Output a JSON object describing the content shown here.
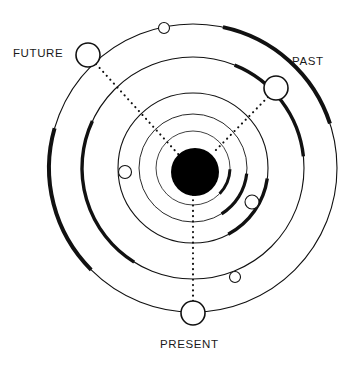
{
  "diagram": {
    "type": "concentric-orbit-diagram",
    "background_color": "#ffffff",
    "stroke_color": "#111111",
    "core_color": "#000000",
    "labels": {
      "future": "FUTURE",
      "past": "PAST",
      "present": "PRESENT"
    },
    "center": {
      "x": 193,
      "y": 168
    },
    "core": {
      "cx": 195,
      "cy": 172,
      "r": 24,
      "fill": "#000000"
    },
    "rings": [
      {
        "name": "ring-outer",
        "r": 144,
        "stroke_width": 1.1
      },
      {
        "name": "ring-second",
        "r": 111,
        "stroke_width": 1.1
      },
      {
        "name": "ring-third",
        "r": 75,
        "stroke_width": 1.1
      },
      {
        "name": "ring-fourth",
        "r": 54,
        "stroke_width": 0.9
      },
      {
        "name": "ring-fifth",
        "r": 37,
        "stroke_width": 0.8
      }
    ],
    "thick_arcs": [
      {
        "name": "arc-outer-right",
        "r": 144,
        "start_deg": -78,
        "end_deg": -18,
        "stroke_width": 4.0
      },
      {
        "name": "arc-outer-left",
        "r": 144,
        "start_deg": 135,
        "end_deg": 196,
        "stroke_width": 4.0
      },
      {
        "name": "arc-second-left",
        "r": 111,
        "start_deg": 122,
        "end_deg": 205,
        "stroke_width": 3.4
      },
      {
        "name": "arc-second-top",
        "r": 111,
        "start_deg": -68,
        "end_deg": -6,
        "stroke_width": 3.4
      },
      {
        "name": "arc-third-right",
        "r": 75,
        "start_deg": 8,
        "end_deg": 62,
        "stroke_width": 3.4
      },
      {
        "name": "arc-fourth-right",
        "r": 54,
        "start_deg": 6,
        "end_deg": 58,
        "stroke_width": 3.2
      },
      {
        "name": "arc-fifth-right",
        "r": 37,
        "start_deg": 2,
        "end_deg": 44,
        "stroke_width": 3.0
      }
    ],
    "markers": [
      {
        "name": "marker-future",
        "cx": 88,
        "cy": 55,
        "r": 12,
        "stroke_width": 1.6,
        "label": "FUTURE"
      },
      {
        "name": "marker-past",
        "cx": 276,
        "cy": 88,
        "r": 12,
        "stroke_width": 1.6,
        "label": "PAST"
      },
      {
        "name": "marker-present",
        "cx": 193,
        "cy": 313,
        "r": 12,
        "stroke_width": 1.6,
        "label": "PRESENT"
      },
      {
        "name": "marker-small-top",
        "cx": 164,
        "cy": 28,
        "r": 5.5,
        "stroke_width": 1.1,
        "label": ""
      },
      {
        "name": "marker-small-left",
        "cx": 125,
        "cy": 172,
        "r": 6.5,
        "stroke_width": 1.1,
        "label": ""
      },
      {
        "name": "marker-small-right",
        "cx": 252,
        "cy": 202,
        "r": 7.0,
        "stroke_width": 1.1,
        "label": ""
      },
      {
        "name": "marker-small-lower-right",
        "cx": 235,
        "cy": 277,
        "r": 5.5,
        "stroke_width": 1.1,
        "label": ""
      }
    ],
    "connectors": [
      {
        "name": "connector-future-core",
        "x1": 96,
        "y1": 64,
        "x2": 179,
        "y2": 155
      },
      {
        "name": "connector-past-core",
        "x1": 268,
        "y1": 97,
        "x2": 213,
        "y2": 153
      },
      {
        "name": "connector-present-core",
        "x1": 193,
        "y1": 301,
        "x2": 193,
        "y2": 185
      }
    ]
  }
}
